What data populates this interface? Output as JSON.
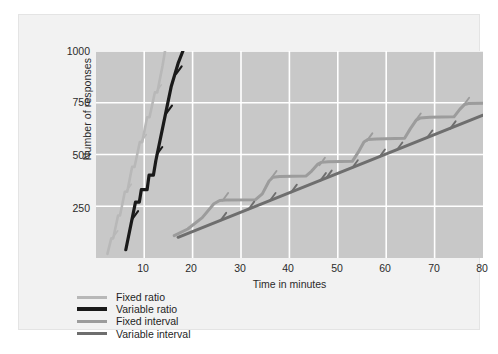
{
  "figure": {
    "background": "#f2f2f2",
    "plot_background": "#c8c8c8",
    "grid_color": "#ffffff"
  },
  "chart_data": {
    "type": "line",
    "title": "",
    "xlabel": "Time in minutes",
    "ylabel": "Number of responses",
    "xlim": [
      0,
      80
    ],
    "ylim": [
      0,
      1000
    ],
    "xticks": [
      10,
      20,
      30,
      40,
      50,
      60,
      70,
      80
    ],
    "yticks": [
      250,
      500,
      750,
      1000
    ],
    "grid": true,
    "legend_position": "below-axes-left",
    "series": [
      {
        "name": "Fixed ratio",
        "color": "#b8b8b8",
        "width": 2.6,
        "style": "steep stair-step with reinforcement hatch marks",
        "points": [
          [
            2.4,
            20
          ],
          [
            3.2,
            95
          ],
          [
            3.6,
            95
          ],
          [
            4.6,
            205
          ],
          [
            5.0,
            205
          ],
          [
            6.0,
            320
          ],
          [
            6.5,
            320
          ],
          [
            7.5,
            440
          ],
          [
            8.0,
            440
          ],
          [
            9.1,
            560
          ],
          [
            9.6,
            560
          ],
          [
            10.6,
            680
          ],
          [
            11.1,
            680
          ],
          [
            12.2,
            800
          ],
          [
            12.7,
            800
          ],
          [
            13.8,
            930
          ],
          [
            14.3,
            1000
          ]
        ],
        "hatches": [
          [
            3.4,
            95
          ],
          [
            6.2,
            320
          ],
          [
            9.3,
            560
          ],
          [
            12.4,
            800
          ]
        ]
      },
      {
        "name": "Variable ratio",
        "color": "#1a1a1a",
        "width": 3.2,
        "style": "steep near-linear with occasional short plateaus",
        "points": [
          [
            6.2,
            40
          ],
          [
            8.2,
            270
          ],
          [
            9.0,
            270
          ],
          [
            9.4,
            330
          ],
          [
            10.6,
            330
          ],
          [
            11.0,
            400
          ],
          [
            11.9,
            400
          ],
          [
            12.4,
            470
          ],
          [
            14.0,
            650
          ],
          [
            15.6,
            830
          ],
          [
            17.0,
            940
          ],
          [
            18.0,
            1000
          ]
        ],
        "hatches": [
          [
            7.6,
            190
          ],
          [
            12.6,
            500
          ],
          [
            14.6,
            700
          ],
          [
            16.6,
            890
          ]
        ]
      },
      {
        "name": "Fixed interval",
        "color": "#9c9c9c",
        "width": 3.0,
        "style": "scalloped — accelerating run then flat pause after each reinforcer",
        "points": [
          [
            16.2,
            108
          ],
          [
            19.0,
            140
          ],
          [
            22.0,
            195
          ],
          [
            24.4,
            262
          ],
          [
            25.6,
            278
          ],
          [
            26.8,
            280
          ],
          [
            33.0,
            282
          ],
          [
            34.4,
            310
          ],
          [
            35.8,
            372
          ],
          [
            36.6,
            390
          ],
          [
            38.0,
            394
          ],
          [
            43.4,
            396
          ],
          [
            44.6,
            420
          ],
          [
            45.8,
            452
          ],
          [
            46.6,
            462
          ],
          [
            48.0,
            465
          ],
          [
            53.0,
            467
          ],
          [
            54.2,
            510
          ],
          [
            55.4,
            560
          ],
          [
            56.2,
            572
          ],
          [
            58.0,
            575
          ],
          [
            63.8,
            578
          ],
          [
            65.0,
            625
          ],
          [
            66.2,
            666
          ],
          [
            67.0,
            676
          ],
          [
            69.0,
            680
          ],
          [
            74.0,
            682
          ],
          [
            75.2,
            718
          ],
          [
            76.2,
            742
          ],
          [
            77.0,
            746
          ],
          [
            80.0,
            748
          ]
        ],
        "hatches": [
          [
            26.2,
            278
          ],
          [
            36.2,
            384
          ],
          [
            46.2,
            448
          ],
          [
            56.0,
            566
          ],
          [
            66.0,
            662
          ],
          [
            76.0,
            738
          ]
        ]
      },
      {
        "name": "Variable interval",
        "color": "#6e6e6e",
        "width": 3.0,
        "style": "steady straight line, slower rate",
        "points": [
          [
            17.0,
            100
          ],
          [
            80.0,
            690
          ]
        ],
        "hatches": [
          [
            25.8,
            182
          ],
          [
            31.6,
            236
          ],
          [
            36.0,
            278
          ],
          [
            40.4,
            318
          ],
          [
            46.4,
            374
          ],
          [
            47.6,
            386
          ],
          [
            53.0,
            436
          ],
          [
            58.6,
            488
          ],
          [
            62.2,
            522
          ],
          [
            68.4,
            580
          ],
          [
            73.2,
            624
          ]
        ]
      }
    ]
  },
  "axes": {
    "y_title": "Number of responses",
    "y_tick_labels": [
      "1000",
      "750",
      "500",
      "250"
    ],
    "x_title": "Time in minutes",
    "x_tick_labels": [
      "10",
      "20",
      "30",
      "40",
      "50",
      "60",
      "70",
      "80"
    ]
  },
  "legend": {
    "items": [
      {
        "label": "Fixed ratio",
        "color": "#b8b8b8",
        "thick": false
      },
      {
        "label": "Variable ratio",
        "color": "#1a1a1a",
        "thick": true
      },
      {
        "label": "Fixed interval",
        "color": "#9c9c9c",
        "thick": false
      },
      {
        "label": "Variable interval",
        "color": "#6e6e6e",
        "thick": false
      }
    ]
  }
}
